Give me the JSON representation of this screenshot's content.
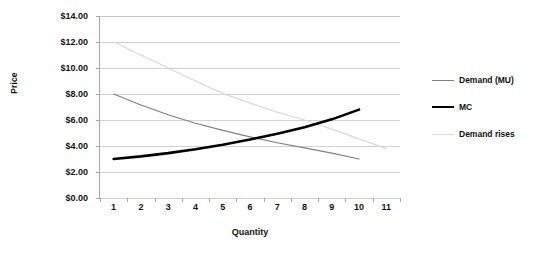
{
  "chart_data": {
    "type": "line",
    "title": "",
    "xlabel": "Quantity",
    "ylabel": "Price",
    "grid": true,
    "legend_position": "right",
    "categories": [
      1,
      2,
      3,
      4,
      5,
      6,
      7,
      8,
      9,
      10,
      11
    ],
    "x_tick_labels": [
      "1",
      "2",
      "3",
      "4",
      "5",
      "6",
      "7",
      "8",
      "9",
      "10",
      "11"
    ],
    "y_tick_labels": [
      "$0.00",
      "$2.00",
      "$4.00",
      "$6.00",
      "$8.00",
      "$10.00",
      "$12.00",
      "$14.00"
    ],
    "y_tick_values": [
      0,
      2,
      4,
      6,
      8,
      10,
      12,
      14
    ],
    "ylim": [
      0,
      14
    ],
    "xlim": [
      1,
      11
    ],
    "series": [
      {
        "name": "Demand (MU)",
        "color": "#808080",
        "width": 1.2,
        "x": [
          1,
          2,
          3,
          4,
          5,
          6,
          7,
          8,
          9,
          10
        ],
        "values": [
          8.0,
          7.15,
          6.4,
          5.75,
          5.2,
          4.7,
          4.25,
          3.85,
          3.45,
          3.0
        ]
      },
      {
        "name": "MC",
        "color": "#000000",
        "width": 2.6,
        "x": [
          1,
          2,
          3,
          4,
          5,
          6,
          7,
          8,
          9,
          10
        ],
        "values": [
          3.0,
          3.2,
          3.45,
          3.75,
          4.1,
          4.5,
          4.95,
          5.45,
          6.05,
          6.8
        ]
      },
      {
        "name": "Demand rises",
        "color": "#d9d9d9",
        "width": 1.2,
        "x": [
          1,
          2,
          3,
          4,
          5,
          6,
          7,
          8,
          9,
          10,
          11
        ],
        "values": [
          12.0,
          11.0,
          10.0,
          9.0,
          8.05,
          7.3,
          6.6,
          6.0,
          5.3,
          4.55,
          3.8
        ]
      }
    ]
  },
  "legend": {
    "items": [
      {
        "label": "Demand (MU)",
        "color": "#808080",
        "thickness": "1.5px"
      },
      {
        "label": "MC",
        "color": "#000000",
        "thickness": "2.5px"
      },
      {
        "label": "Demand rises",
        "color": "#dcdcdc",
        "thickness": "1.5px"
      }
    ]
  },
  "axes": {
    "x_title": "Quantity",
    "y_title": "Price"
  },
  "colors": {
    "gridline": "#d2d2d2",
    "axis": "#a6a6a6",
    "text": "#111111",
    "background": "#ffffff"
  }
}
